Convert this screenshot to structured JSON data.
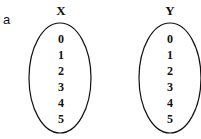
{
  "panel_label": "a",
  "sets": [
    {
      "name": "X",
      "elements": [
        "0",
        "1",
        "2",
        "3",
        "4",
        "5"
      ]
    },
    {
      "name": "Y",
      "elements": [
        "0",
        "1",
        "2",
        "3",
        "4",
        "5"
      ]
    }
  ]
}
